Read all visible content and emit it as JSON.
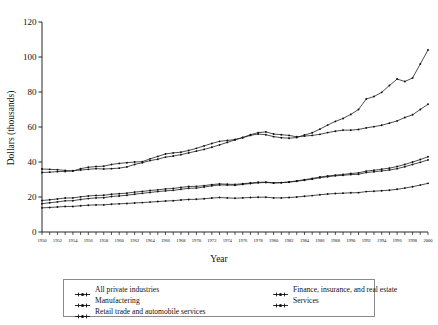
{
  "chart_data": {
    "type": "line",
    "title": "",
    "xlabel": "Year",
    "ylabel": "Dollars (thousands)",
    "xlim": [
      1950,
      2000
    ],
    "ylim": [
      0,
      120
    ],
    "ytick_values": [
      0,
      20,
      40,
      60,
      80,
      100,
      120
    ],
    "ytick_labels": [
      "0",
      "20",
      "40",
      "60",
      "80",
      "100",
      "120"
    ],
    "grid": false,
    "legend_position": "below-plot",
    "x": [
      1950,
      1951,
      1952,
      1953,
      1954,
      1955,
      1956,
      1957,
      1958,
      1959,
      1960,
      1961,
      1962,
      1963,
      1964,
      1965,
      1966,
      1967,
      1968,
      1969,
      1970,
      1971,
      1972,
      1973,
      1974,
      1975,
      1976,
      1977,
      1978,
      1979,
      1980,
      1981,
      1982,
      1983,
      1984,
      1985,
      1986,
      1987,
      1988,
      1989,
      1990,
      1991,
      1992,
      1993,
      1994,
      1995,
      1996,
      1997,
      1998,
      1999,
      2000
    ],
    "xtick_labels": [
      "1950",
      "1952",
      "1954",
      "1956",
      "1958",
      "1960",
      "1962",
      "1964",
      "1966",
      "1968",
      "1970",
      "1972",
      "1974",
      "1976",
      "1978",
      "1980",
      "1982",
      "1984",
      "1986",
      "1988",
      "1990",
      "1992",
      "1994",
      "1996",
      "1998",
      "2000"
    ],
    "series": [
      {
        "name": "All private industries",
        "values": [
          18.0,
          18.4,
          18.9,
          19.4,
          19.5,
          20.1,
          20.6,
          20.9,
          21.0,
          21.6,
          21.9,
          22.2,
          22.8,
          23.2,
          23.7,
          24.1,
          24.6,
          24.9,
          25.5,
          26.0,
          26.1,
          26.5,
          27.1,
          27.5,
          27.3,
          27.2,
          27.6,
          28.0,
          28.4,
          28.5,
          28.1,
          28.2,
          28.5,
          29.0,
          29.6,
          30.2,
          31.0,
          31.6,
          32.1,
          32.4,
          32.8,
          33.0,
          34.0,
          34.4,
          34.9,
          35.4,
          36.2,
          37.3,
          38.6,
          39.8,
          41.2
        ]
      },
      {
        "name": "Manufactering",
        "values": [
          16.2,
          16.7,
          17.2,
          17.8,
          17.9,
          18.6,
          19.1,
          19.5,
          19.6,
          20.3,
          20.6,
          21.0,
          21.6,
          22.1,
          22.6,
          23.1,
          23.5,
          23.8,
          24.4,
          25.0,
          25.1,
          25.7,
          26.4,
          26.9,
          26.8,
          26.7,
          27.2,
          27.7,
          28.1,
          28.3,
          28.0,
          28.2,
          28.6,
          29.2,
          29.9,
          30.6,
          31.4,
          32.0,
          32.5,
          32.9,
          33.4,
          33.8,
          34.8,
          35.3,
          35.9,
          36.5,
          37.4,
          38.6,
          40.0,
          41.4,
          43.0
        ]
      },
      {
        "name": "Retail trade and automobile services",
        "values": [
          13.8,
          14.0,
          14.3,
          14.6,
          14.6,
          15.0,
          15.3,
          15.5,
          15.5,
          15.9,
          16.1,
          16.3,
          16.6,
          16.8,
          17.1,
          17.4,
          17.7,
          17.9,
          18.3,
          18.6,
          18.7,
          19.0,
          19.4,
          19.7,
          19.5,
          19.3,
          19.5,
          19.7,
          19.9,
          19.9,
          19.5,
          19.5,
          19.7,
          20.0,
          20.4,
          20.8,
          21.3,
          21.7,
          22.0,
          22.2,
          22.4,
          22.5,
          23.1,
          23.3,
          23.6,
          23.9,
          24.4,
          25.1,
          25.9,
          26.8,
          27.8
        ]
      },
      {
        "name": "Finance, insurance, and real estate",
        "values": [
          36.0,
          35.8,
          35.6,
          35.2,
          34.8,
          36.2,
          37.0,
          37.4,
          37.6,
          38.6,
          39.2,
          39.6,
          40.0,
          40.2,
          41.8,
          43.2,
          44.6,
          45.2,
          45.6,
          46.6,
          47.8,
          49.2,
          50.6,
          51.8,
          52.3,
          52.9,
          53.9,
          55.2,
          56.0,
          55.6,
          54.5,
          53.9,
          53.6,
          54.0,
          55.4,
          56.7,
          58.8,
          61.1,
          63.2,
          64.9,
          67.2,
          70.0,
          76.0,
          77.4,
          79.8,
          83.7,
          87.4,
          86.0,
          88.0,
          96.0,
          104.0
        ]
      },
      {
        "name": "Services",
        "values": [
          34.0,
          34.2,
          34.5,
          34.6,
          35.0,
          35.4,
          35.8,
          36.2,
          36.0,
          36.2,
          36.5,
          37.2,
          38.6,
          39.6,
          40.8,
          41.6,
          42.8,
          43.4,
          44.2,
          45.2,
          46.2,
          47.2,
          48.4,
          49.8,
          51.2,
          52.6,
          54.0,
          55.6,
          56.8,
          57.2,
          56.0,
          55.6,
          55.2,
          54.4,
          54.8,
          55.2,
          55.8,
          56.8,
          57.6,
          58.2,
          58.2,
          58.6,
          59.5,
          60.2,
          61.0,
          62.2,
          63.5,
          65.4,
          67.0,
          70.0,
          73.0
        ]
      }
    ],
    "legend_entries": [
      "All private industries",
      "Manufactering",
      "Retail trade and automobile services",
      "Finance, insurance, and real estate",
      "Services"
    ],
    "line_color": "#111111"
  }
}
